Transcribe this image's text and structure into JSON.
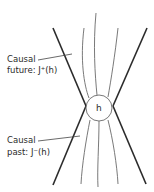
{
  "diagram": {
    "center_label": "h",
    "labels": {
      "future_line1": "Causal",
      "future_line2": "future: J⁺(h)",
      "past_line1": "Causal",
      "past_line2": "past: J⁻(h)"
    },
    "colors": {
      "light_cone": "#2b2b2b",
      "worldlines": "#6a6a6a",
      "circle": "#6a6a6a",
      "text": "#2a2a2a",
      "background": "#ffffff"
    }
  }
}
